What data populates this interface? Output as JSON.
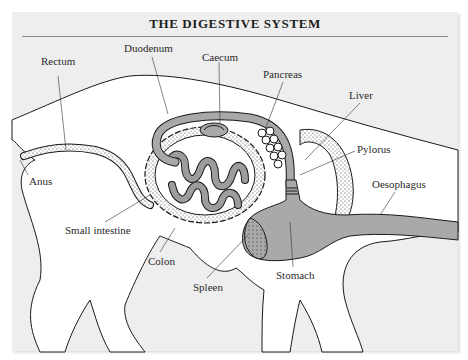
{
  "title": "THE DIGESTIVE SYSTEM",
  "colors": {
    "background": "#eeeeee",
    "body": "#ffffff",
    "organ_fill": "#a9a9a9",
    "outline": "#1a1a1a"
  },
  "labels": [
    {
      "id": "rectum",
      "text": "Rectum"
    },
    {
      "id": "duodenum",
      "text": "Duodenum"
    },
    {
      "id": "caecum",
      "text": "Caecum"
    },
    {
      "id": "pancreas",
      "text": "Pancreas"
    },
    {
      "id": "liver",
      "text": "Liver"
    },
    {
      "id": "pylorus",
      "text": "Pylorus"
    },
    {
      "id": "anus",
      "text": "Anus"
    },
    {
      "id": "oesophagus",
      "text": "Oesophagus"
    },
    {
      "id": "small_intestine",
      "text": "Small intestine"
    },
    {
      "id": "colon",
      "text": "Colon"
    },
    {
      "id": "spleen",
      "text": "Spleen"
    },
    {
      "id": "stomach",
      "text": "Stomach"
    }
  ]
}
